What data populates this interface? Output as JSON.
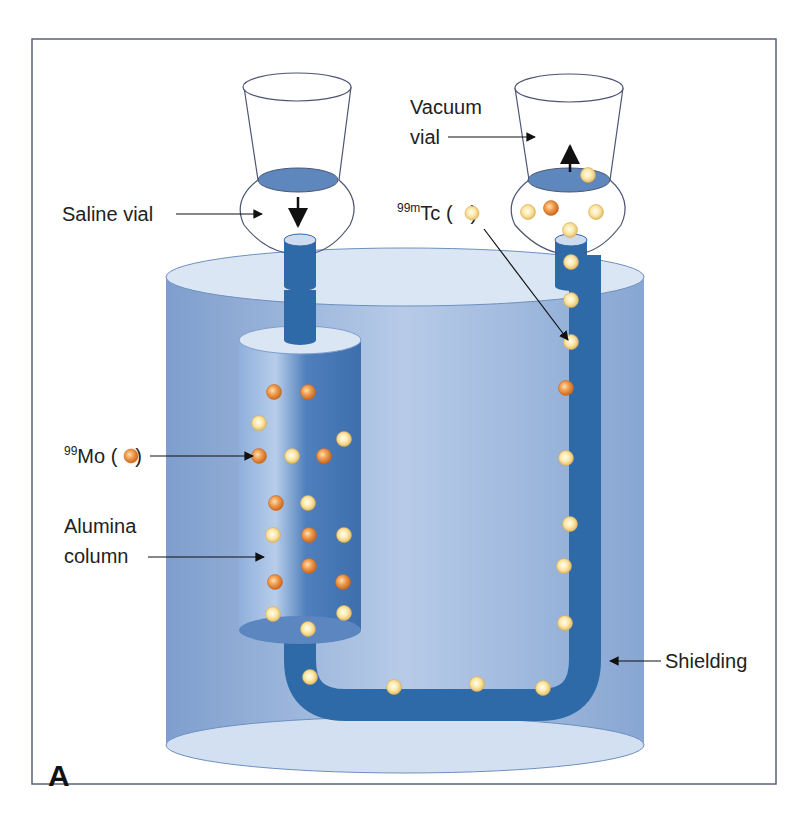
{
  "figure": {
    "panel_label": "A",
    "colors": {
      "frame": "#5a6275",
      "shield_body": "#7d9dcc",
      "shield_top": "#dbe6f5",
      "shield_bottom": "#d3e0f2",
      "tube": "#2f6aa8",
      "liquid": "#5d87bd",
      "mo_particle": "#e8893f",
      "tc_particle": "#f6dc8a"
    },
    "labels": {
      "saline_vial": "Saline vial",
      "vacuum_vial_line1": "Vacuum",
      "vacuum_vial_line2": "vial",
      "tc_sup": "99m",
      "tc_main": "Tc (",
      "tc_close": ")",
      "mo_sup": "99",
      "mo_main": "Mo (",
      "mo_close": ")",
      "alumina_line1": "Alumina",
      "alumina_line2": "column",
      "shielding": "Shielding"
    },
    "particles": {
      "column": [
        {
          "x": 274,
          "y": 392,
          "type": "mo"
        },
        {
          "x": 308,
          "y": 392,
          "type": "mo"
        },
        {
          "x": 259,
          "y": 423,
          "type": "tc"
        },
        {
          "x": 344,
          "y": 439,
          "type": "tc"
        },
        {
          "x": 259,
          "y": 456,
          "type": "mo"
        },
        {
          "x": 292,
          "y": 456,
          "type": "tc"
        },
        {
          "x": 324,
          "y": 456,
          "type": "mo"
        },
        {
          "x": 276,
          "y": 503,
          "type": "mo"
        },
        {
          "x": 308,
          "y": 503,
          "type": "tc"
        },
        {
          "x": 273,
          "y": 535,
          "type": "tc"
        },
        {
          "x": 309,
          "y": 535,
          "type": "mo"
        },
        {
          "x": 344,
          "y": 535,
          "type": "tc"
        },
        {
          "x": 309,
          "y": 566,
          "type": "mo"
        },
        {
          "x": 275,
          "y": 582,
          "type": "mo"
        },
        {
          "x": 343,
          "y": 582,
          "type": "mo"
        },
        {
          "x": 273,
          "y": 614,
          "type": "tc"
        },
        {
          "x": 308,
          "y": 629,
          "type": "tc"
        },
        {
          "x": 344,
          "y": 613,
          "type": "tc"
        }
      ],
      "tube": [
        {
          "x": 571,
          "y": 262,
          "type": "tc"
        },
        {
          "x": 571,
          "y": 300,
          "type": "tc"
        },
        {
          "x": 571,
          "y": 342,
          "type": "tc"
        },
        {
          "x": 566,
          "y": 388,
          "type": "mo"
        },
        {
          "x": 566,
          "y": 458,
          "type": "tc"
        },
        {
          "x": 570,
          "y": 524,
          "type": "tc"
        },
        {
          "x": 564,
          "y": 566,
          "type": "tc"
        },
        {
          "x": 565,
          "y": 623,
          "type": "tc"
        },
        {
          "x": 310,
          "y": 677,
          "type": "tc"
        },
        {
          "x": 394,
          "y": 687,
          "type": "tc"
        },
        {
          "x": 477,
          "y": 684,
          "type": "tc"
        },
        {
          "x": 543,
          "y": 688,
          "type": "tc"
        }
      ],
      "vacuum_vial": [
        {
          "x": 588,
          "y": 175,
          "type": "tc"
        },
        {
          "x": 528,
          "y": 212,
          "type": "tc"
        },
        {
          "x": 551,
          "y": 208,
          "type": "mo"
        },
        {
          "x": 596,
          "y": 212,
          "type": "tc"
        },
        {
          "x": 570,
          "y": 230,
          "type": "tc"
        }
      ]
    }
  }
}
